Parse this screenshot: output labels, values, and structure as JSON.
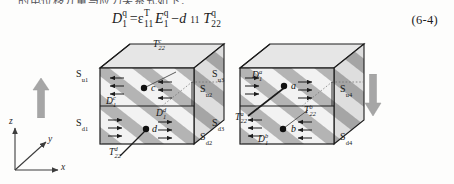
{
  "page": {
    "clipped_top_line": "的电位移分量与应力关系式如下："
  },
  "equation": {
    "lhs_symbol": "D",
    "lhs_sub": "1",
    "lhs_sup": "q",
    "equals": "=",
    "perm_symbol": "ε",
    "perm_sub": "11",
    "perm_sup": "T",
    "field_symbol": "E",
    "field_sub": "1",
    "field_sup": "q",
    "minus": "−",
    "d_symbol": "d",
    "d_sub": "11",
    "stress_symbol": "T",
    "stress_sub": "22",
    "stress_sup": "q",
    "number": "(6-4)"
  },
  "axes": {
    "z": "z",
    "y": "y",
    "x": "x"
  },
  "left_figure": {
    "name": "left-cube",
    "surface_labels": [
      {
        "base": "S",
        "sub": "u1",
        "name": "surface-su1"
      },
      {
        "base": "S",
        "sub": "d1",
        "name": "surface-sd1"
      },
      {
        "base": "S",
        "sub": "u2",
        "name": "surface-su2"
      },
      {
        "base": "S",
        "sub": "d2",
        "name": "surface-sd2"
      }
    ],
    "points": [
      {
        "label": "c",
        "name": "point-c"
      },
      {
        "label": "d",
        "name": "point-d"
      }
    ],
    "vectors": [
      {
        "base": "D",
        "sub": "1",
        "sup": "c",
        "name": "vector-d1c"
      },
      {
        "base": "D",
        "sub": "1",
        "sup": "d",
        "name": "vector-d1d"
      }
    ],
    "stresses": [
      {
        "base": "T",
        "sub": "22",
        "sup": "c",
        "name": "stress-t22c"
      },
      {
        "base": "T",
        "sub": "22",
        "sup": "d",
        "name": "stress-t22d"
      }
    ]
  },
  "right_figure": {
    "name": "right-cube",
    "surface_labels": [
      {
        "base": "S",
        "sub": "u3",
        "name": "surface-su3"
      },
      {
        "base": "S",
        "sub": "d3",
        "name": "surface-sd3"
      },
      {
        "base": "S",
        "sub": "u4",
        "name": "surface-su4"
      },
      {
        "base": "S",
        "sub": "d4",
        "name": "surface-sd4"
      }
    ],
    "points": [
      {
        "label": "a",
        "name": "point-a"
      },
      {
        "label": "b",
        "name": "point-b"
      }
    ],
    "vectors": [
      {
        "base": "D",
        "sub": "1",
        "sup": "a",
        "name": "vector-d1a"
      },
      {
        "base": "D",
        "sub": "1",
        "sup": "b",
        "name": "vector-d1b"
      }
    ],
    "stresses": [
      {
        "base": "T",
        "sub": "22",
        "sup": "a",
        "name": "stress-t22a"
      },
      {
        "base": "T",
        "sub": "22",
        "sup": "b",
        "name": "stress-t22b"
      }
    ]
  },
  "colors": {
    "page_bg": "#fdfdfc",
    "stripe_dark": "#b0b0b0",
    "stripe_light": "#efefef",
    "top_face": "#e3e3e3",
    "side_face": "#c9c9c9",
    "outline": "#1c1c1c",
    "arrow_grey": "#9a9a9a",
    "text": "#161616"
  }
}
